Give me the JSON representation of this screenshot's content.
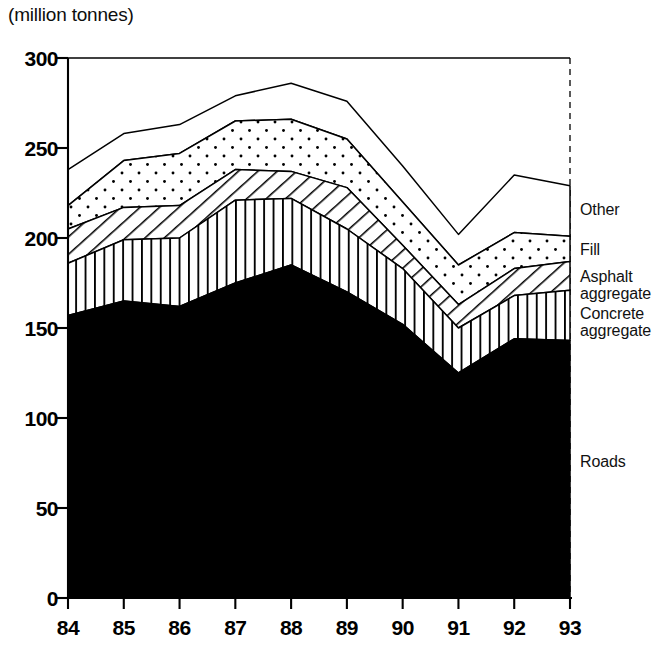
{
  "title": "(million tonnes)",
  "chart_data": {
    "type": "area",
    "title": "(million tonnes)",
    "subtitle": "",
    "xlabel": "",
    "ylabel": "million tonnes",
    "stacked": true,
    "grid": false,
    "legend_position": "right-inline",
    "ylim": [
      0,
      300
    ],
    "yticks": [
      0,
      50,
      100,
      150,
      200,
      250,
      300
    ],
    "ytick_labels": [
      "0",
      "50",
      "100",
      "150",
      "200",
      "250",
      "300"
    ],
    "categories": [
      "84",
      "85",
      "86",
      "87",
      "88",
      "89",
      "90",
      "91",
      "92",
      "93"
    ],
    "x": [
      84,
      85,
      86,
      87,
      88,
      89,
      90,
      91,
      92,
      93
    ],
    "xtick_labels": [
      "84",
      "85",
      "86",
      "87",
      "88",
      "89",
      "90",
      "91",
      "92",
      "93"
    ],
    "series": [
      {
        "name": "Roads",
        "pattern": "solid-black",
        "color": "#000000",
        "values": [
          157,
          165,
          162,
          175,
          185,
          170,
          152,
          125,
          144,
          143
        ]
      },
      {
        "name": "Concrete aggregate",
        "pattern": "vertical-lines",
        "color": "#ffffff",
        "values": [
          29,
          34,
          38,
          46,
          37,
          35,
          31,
          25,
          24,
          28
        ]
      },
      {
        "name": "Asphalt aggregate",
        "pattern": "diagonal-hatch",
        "color": "#ffffff",
        "values": [
          19,
          18,
          18,
          17,
          15,
          23,
          13,
          13,
          15,
          16
        ]
      },
      {
        "name": "Fill",
        "pattern": "dotted",
        "color": "#ffffff",
        "values": [
          13,
          26,
          29,
          27,
          29,
          27,
          24,
          22,
          20,
          14
        ]
      },
      {
        "name": "Other",
        "pattern": "blank",
        "color": "#ffffff",
        "values": [
          20,
          15,
          16,
          14,
          20,
          21,
          20,
          17,
          32,
          28
        ]
      }
    ],
    "cumulative": {
      "roads": [
        157,
        165,
        162,
        175,
        185,
        170,
        152,
        125,
        144,
        143
      ],
      "plus_concrete": [
        186,
        199,
        200,
        221,
        222,
        205,
        183,
        150,
        168,
        171
      ],
      "plus_asphalt": [
        205,
        217,
        218,
        238,
        237,
        228,
        196,
        163,
        183,
        187
      ],
      "plus_fill": [
        218,
        243,
        247,
        265,
        266,
        255,
        220,
        185,
        203,
        201
      ],
      "total": [
        238,
        258,
        263,
        279,
        286,
        276,
        240,
        202,
        235,
        229
      ]
    },
    "annotations": [
      {
        "text": "Other",
        "at_year": 93,
        "at_value": 215
      },
      {
        "text": "Fill",
        "at_year": 93,
        "at_value": 193
      },
      {
        "text": "Asphalt\naggregate",
        "at_year": 93,
        "at_value": 178
      },
      {
        "text": "Concrete\naggregate",
        "at_year": 93,
        "at_value": 157
      },
      {
        "text": "Roads",
        "at_year": 93,
        "at_value": 75
      }
    ]
  },
  "axes": {
    "y_labels": [
      "300",
      "250",
      "200",
      "150",
      "100",
      "50",
      "0"
    ],
    "x_labels": [
      "84",
      "85",
      "86",
      "87",
      "88",
      "89",
      "90",
      "91",
      "92",
      "93"
    ]
  },
  "legend": {
    "items": [
      {
        "label": "Other"
      },
      {
        "label": "Fill"
      },
      {
        "label": "Asphalt\naggregate"
      },
      {
        "label": "Concrete\naggregate"
      },
      {
        "label": "Roads"
      }
    ]
  },
  "colors": {
    "ink": "#000000",
    "paper": "#ffffff"
  }
}
